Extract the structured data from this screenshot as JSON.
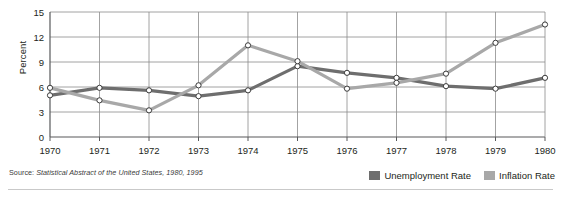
{
  "chart_data": {
    "type": "line",
    "title": "",
    "xlabel": "",
    "ylabel": "Percent",
    "categories": [
      "1970",
      "1971",
      "1972",
      "1973",
      "1974",
      "1975",
      "1976",
      "1977",
      "1978",
      "1979",
      "1980"
    ],
    "x": [
      1970,
      1971,
      1972,
      1973,
      1974,
      1975,
      1976,
      1977,
      1978,
      1979,
      1980
    ],
    "ylim": [
      0,
      15
    ],
    "yticks": [
      0,
      3,
      6,
      9,
      12,
      15
    ],
    "grid": true,
    "legend_position": "bottom-right",
    "markers": "open-circle",
    "series": [
      {
        "name": "Unemployment Rate",
        "color": "#6e6e6e",
        "values": [
          5.0,
          5.9,
          5.6,
          4.9,
          5.6,
          8.5,
          7.7,
          7.1,
          6.1,
          5.8,
          7.1
        ]
      },
      {
        "name": "Inflation Rate",
        "color": "#a8a8a8",
        "values": [
          5.9,
          4.4,
          3.2,
          6.2,
          11.0,
          9.1,
          5.8,
          6.5,
          7.6,
          11.3,
          13.5
        ]
      }
    ]
  },
  "axis": {
    "y_label": "Percent",
    "y_ticks": [
      "15",
      "12",
      "9",
      "6",
      "3",
      "0"
    ],
    "x_ticks": [
      "1970",
      "1971",
      "1972",
      "1973",
      "1974",
      "1975",
      "1976",
      "1977",
      "1978",
      "1979",
      "1980"
    ]
  },
  "legend": {
    "items": [
      {
        "label": "Unemployment Rate",
        "color": "#6e6e6e"
      },
      {
        "label": "Inflation Rate",
        "color": "#a8a8a8"
      }
    ]
  },
  "source": {
    "prefix": "Source: ",
    "title": "Statistical Abstract of the United States, 1980, 1995"
  },
  "colors": {
    "unemployment": "#6e6e6e",
    "inflation": "#a8a8a8",
    "grid": "#8c8c8c",
    "axis": "#58595b",
    "text": "#231f20"
  }
}
